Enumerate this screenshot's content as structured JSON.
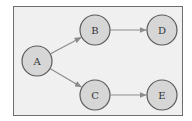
{
  "diagram": {
    "type": "directed-graph",
    "colors": {
      "frame_background": "#f0f0f0",
      "frame_border": "#6e6e6e",
      "node_fill": "#d6d6d6",
      "node_stroke": "#5a5a5a",
      "edge_color": "#8c8c8c",
      "label_color": "#333333"
    },
    "nodes": [
      {
        "id": "A",
        "label": "A",
        "x": 37,
        "y": 61,
        "r": 15
      },
      {
        "id": "B",
        "label": "B",
        "x": 95,
        "y": 30,
        "r": 15
      },
      {
        "id": "C",
        "label": "C",
        "x": 95,
        "y": 95,
        "r": 15
      },
      {
        "id": "D",
        "label": "D",
        "x": 162,
        "y": 30,
        "r": 15
      },
      {
        "id": "E",
        "label": "E",
        "x": 162,
        "y": 95,
        "r": 15
      }
    ],
    "edges": [
      {
        "from": "A",
        "to": "B"
      },
      {
        "from": "A",
        "to": "C"
      },
      {
        "from": "B",
        "to": "D"
      },
      {
        "from": "C",
        "to": "E"
      }
    ]
  }
}
